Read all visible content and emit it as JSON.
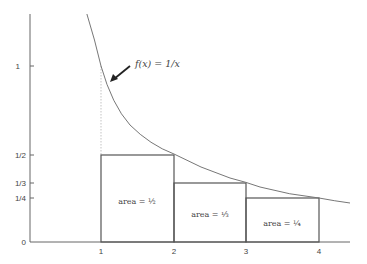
{
  "diagram": {
    "function_label": "f(x) = 1/x",
    "y_ticks": [
      {
        "label": "1",
        "value": 1
      },
      {
        "label": "1/2",
        "value": 0.5
      },
      {
        "label": "1/3",
        "value": 0.3333
      },
      {
        "label": "1/4",
        "value": 0.25
      },
      {
        "label": "0",
        "value": 0
      }
    ],
    "x_ticks": [
      {
        "label": "1",
        "value": 1
      },
      {
        "label": "2",
        "value": 2
      },
      {
        "label": "3",
        "value": 3
      },
      {
        "label": "4",
        "value": 4
      }
    ],
    "rectangles": [
      {
        "x0": 1,
        "x1": 2,
        "height": 0.5,
        "label": "area = ½"
      },
      {
        "x0": 2,
        "x1": 3,
        "height": 0.3333,
        "label": "area = ⅓"
      },
      {
        "x0": 3,
        "x1": 4,
        "height": 0.25,
        "label": "area = ¼"
      }
    ],
    "colors": {
      "line": "#555555",
      "curve": "#777777",
      "text": "#444444"
    }
  }
}
